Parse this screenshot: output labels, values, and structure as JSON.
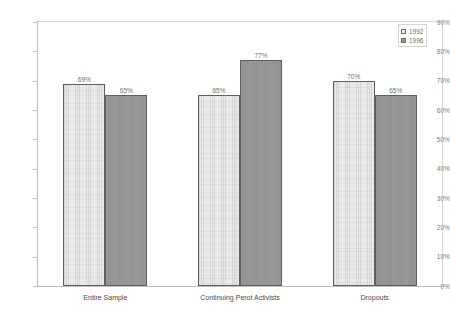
{
  "chart_data": {
    "type": "bar",
    "title": "",
    "subtitle": "",
    "xlabel": "",
    "ylabel": "",
    "categories": [
      "Entire Sample",
      "Continuing Perot Activists",
      "Dropouts"
    ],
    "series": [
      {
        "name": "1992",
        "color": "#e9e9e9",
        "values": [
          69,
          65,
          70
        ],
        "labels": [
          "69%",
          "65%",
          "70%"
        ]
      },
      {
        "name": "1996",
        "color": "#969696",
        "values": [
          65,
          77,
          65
        ],
        "labels": [
          "65%",
          "77%",
          "65%"
        ]
      }
    ],
    "ylim": [
      0,
      90
    ],
    "ytick_step": 10,
    "ytick_labels": [
      "90%",
      "80%",
      "70%",
      "60%",
      "50%",
      "40%",
      "30%",
      "20%",
      "10%",
      "0%"
    ],
    "ytick_values": [
      90,
      80,
      70,
      60,
      50,
      40,
      30,
      20,
      10,
      0
    ],
    "value_suffix": "%",
    "grid": false,
    "legend_position": "top-right",
    "plot_border_color": "#d9d9d9",
    "axis_color": "#bdbdbd",
    "tick_label_color": "#7b7b7b",
    "data_label_color": "#6e6e6e",
    "category_label_color": "#4a4a4a",
    "bar_border_color": "#5f5f5f",
    "background_color": "#ffffff"
  },
  "legend": {
    "entries": [
      {
        "label": "1992"
      },
      {
        "label": "1996"
      }
    ]
  }
}
